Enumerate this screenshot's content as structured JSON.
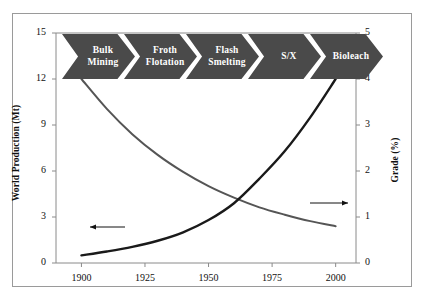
{
  "chart_data": {
    "type": "line",
    "title": "",
    "xlabel": "",
    "xlim": [
      1890,
      2008
    ],
    "xticks": [
      1900,
      1925,
      1950,
      1975,
      2000
    ],
    "xtick_labels": [
      "1900",
      "1925",
      "1950",
      "1975",
      "2000"
    ],
    "grid": false,
    "legend_position": "none",
    "axes": [
      {
        "id": "left",
        "ylabel": "World Production (Mt)",
        "ylim": [
          0,
          15
        ],
        "yticks": [
          0,
          3,
          6,
          9,
          12,
          15
        ],
        "ytick_labels": [
          "0",
          "3",
          "6",
          "9",
          "12",
          "15"
        ]
      },
      {
        "id": "right",
        "ylabel": "Grade (%)",
        "ylim": [
          0,
          5
        ],
        "yticks": [
          0,
          1,
          2,
          3,
          4,
          5
        ],
        "ytick_labels": [
          "0",
          "1",
          "2",
          "3",
          "4",
          "5"
        ]
      }
    ],
    "series": [
      {
        "name": "World Production",
        "axis": "left",
        "units": "Mt",
        "color": "#1a1a1a",
        "x": [
          1900,
          1910,
          1920,
          1930,
          1940,
          1950,
          1960,
          1970,
          1980,
          1990,
          2000
        ],
        "values": [
          0.5,
          0.75,
          1.05,
          1.45,
          2.0,
          2.8,
          3.9,
          5.5,
          7.3,
          9.5,
          12.0
        ]
      },
      {
        "name": "Grade",
        "axis": "right",
        "units": "%",
        "color": "#555555",
        "x": [
          1900,
          1910,
          1920,
          1930,
          1940,
          1950,
          1960,
          1970,
          1980,
          1990,
          2000
        ],
        "values": [
          4.0,
          3.35,
          2.8,
          2.35,
          1.98,
          1.67,
          1.42,
          1.21,
          1.05,
          0.91,
          0.8
        ]
      }
    ],
    "annotations": [
      {
        "name": "production-arrow",
        "type": "arrow",
        "direction": "left",
        "target_axis": "left",
        "description": "arrow pointing to left axis from production curve"
      },
      {
        "name": "grade-arrow",
        "type": "arrow",
        "direction": "right",
        "target_axis": "right",
        "description": "arrow pointing to right axis from grade curve"
      }
    ],
    "milestones": [
      {
        "label_line1": "Bulk",
        "label_line2": "Mining"
      },
      {
        "label_line1": "Froth",
        "label_line2": "Flotation"
      },
      {
        "label_line1": "Flash",
        "label_line2": "Smelting"
      },
      {
        "label_line1": "S/X",
        "label_line2": ""
      },
      {
        "label_line1": "Bioleach",
        "label_line2": ""
      }
    ],
    "colors": {
      "milestone_fill": "#4a4a4a",
      "milestone_text": "#ffffff",
      "production_line": "#1a1a1a",
      "grade_line": "#555555",
      "axis": "#8a8a8a",
      "frame": "#9a9a9a"
    }
  }
}
